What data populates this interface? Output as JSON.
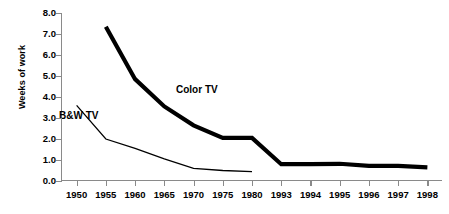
{
  "chart_data": {
    "type": "line",
    "title": "",
    "xlabel": "",
    "ylabel": "Weeks of work",
    "categories": [
      "1950",
      "1955",
      "1960",
      "1965",
      "1970",
      "1975",
      "1980",
      "1993",
      "1994",
      "1995",
      "1996",
      "1997",
      "1998"
    ],
    "ylim": [
      0.0,
      8.0
    ],
    "ytick_step": 1.0,
    "ytick_labels": [
      "8.0",
      "7.0",
      "6.0",
      "5.0",
      "4.0",
      "3.0",
      "2.0",
      "1.0",
      "0.0"
    ],
    "ytick_values": [
      8.0,
      7.0,
      6.0,
      5.0,
      4.0,
      3.0,
      2.0,
      1.0,
      0.0
    ],
    "grid": false,
    "legend": "inline-annotations",
    "series": [
      {
        "name": "Color TV",
        "color": "#000000",
        "line_width": 4.2,
        "x": [
          "1955",
          "1960",
          "1965",
          "1970",
          "1975",
          "1980",
          "1993",
          "1994",
          "1995",
          "1996",
          "1997",
          "1998"
        ],
        "values": [
          7.35,
          4.85,
          3.55,
          2.65,
          2.05,
          2.05,
          0.8,
          0.8,
          0.82,
          0.72,
          0.72,
          0.65
        ]
      },
      {
        "name": "B&W TV",
        "color": "#000000",
        "line_width": 1.3,
        "x": [
          "1950",
          "1955",
          "1960",
          "1965",
          "1970",
          "1975",
          "1980"
        ],
        "values": [
          3.6,
          2.0,
          1.55,
          1.05,
          0.6,
          0.5,
          0.45
        ]
      }
    ],
    "annotations": [
      {
        "text": "Color TV",
        "series": "Color TV"
      },
      {
        "text": "B&W TV",
        "series": "B&W TV"
      }
    ]
  },
  "axis": {
    "color": "#8a8a8a"
  }
}
